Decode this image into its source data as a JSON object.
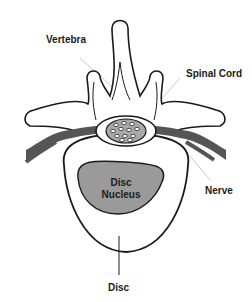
{
  "diagram": {
    "labels": {
      "vertebra": "Vertebra",
      "spinal_cord": "Spinal Cord",
      "nerve": "Nerve",
      "disc_nucleus_line1": "Disc",
      "disc_nucleus_line2": "Nucleus",
      "disc": "Disc"
    },
    "colors": {
      "outline": "#1a1a1a",
      "nerve": "#555555",
      "nucleus": "#9a9a9a",
      "cord": "#a8a8a8",
      "leader": "#cccccc"
    }
  }
}
